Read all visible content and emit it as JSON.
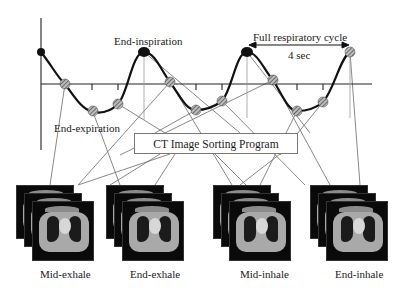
{
  "diagram": {
    "title_annotations": {
      "end_inspiration": "End-inspiration",
      "end_expiration": "End-expiration",
      "full_cycle": "Full respiratory cycle",
      "cycle_duration": "4 sec"
    },
    "program_box": {
      "label": "CT Image Sorting Program"
    },
    "phases": [
      {
        "label": "Mid-exhale"
      },
      {
        "label": "End-exhale"
      },
      {
        "label": "Mid-inhale"
      },
      {
        "label": "End-inhale"
      }
    ],
    "colors": {
      "curve": "#111111",
      "axis": "#222222",
      "connector": "#777777",
      "sample_marker": "#888888",
      "peak_marker": "#111111"
    }
  }
}
